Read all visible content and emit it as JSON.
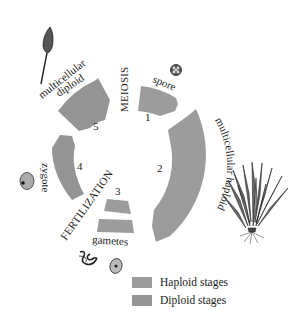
{
  "diagram": {
    "events": {
      "meiosis": "MEIOSIS",
      "fertilization": "FERTILIZATION"
    },
    "stages": [
      {
        "number": "1",
        "label": "spore",
        "type": "haploid"
      },
      {
        "number": "2",
        "label": "multicellular haploid",
        "type": "haploid"
      },
      {
        "number": "3",
        "label": "gametes",
        "type": "haploid"
      },
      {
        "number": "4",
        "label": "zygote",
        "type": "diploid"
      },
      {
        "number": "5",
        "label": "multicellular diploid",
        "type": "diploid"
      }
    ],
    "diploid_label_line1": "multicellular",
    "diploid_label_line2": "diploid",
    "haploid_label": "multicellular haploid",
    "illustrations": [
      "sporophyte-capsule",
      "spore",
      "gametophyte-plant",
      "sperm",
      "egg",
      "zygote"
    ]
  },
  "legend": {
    "items": [
      {
        "label": "Haploid stages",
        "color": "#9c9c9c"
      },
      {
        "label": "Diploid stages",
        "color": "#949494"
      }
    ]
  },
  "colors": {
    "haploid": "#9c9c9c",
    "diploid": "#949494",
    "ink": "#1a1a1a"
  }
}
